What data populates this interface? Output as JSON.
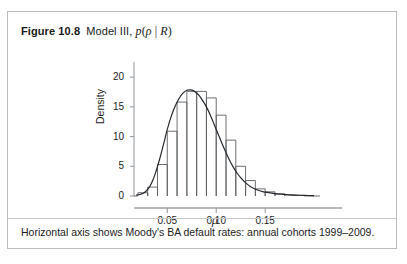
{
  "figure": {
    "number_label": "Figure 10.8",
    "title_text": "Model III, p(ρ | R)",
    "title_parts": {
      "prefix": "Model III,",
      "func": "p",
      "open": "(",
      "arg": "ρ",
      "bar": "|",
      "cond": "R",
      "close": ")"
    },
    "caption": "Horizontal axis shows Moody's BA default rates: annual cohorts 1999–2009.",
    "border_color": "#b9bdc0",
    "background": "#ffffff"
  },
  "chart_data": {
    "type": "bar",
    "xlabel": "ρ",
    "ylabel": "Density",
    "xlim": [
      0.016,
      0.206
    ],
    "ylim": [
      0,
      21.2
    ],
    "xticks": [
      0.05,
      0.1,
      0.15
    ],
    "xtick_labels": [
      "0.05",
      "0.10",
      "0.15"
    ],
    "yticks": [
      0,
      5,
      10,
      15,
      20
    ],
    "ytick_labels": [
      "0",
      "5",
      "10",
      "15",
      "20"
    ],
    "grid": false,
    "legend": null,
    "bin_width": 0.01,
    "bin_edges": [
      0.02,
      0.03,
      0.04,
      0.05,
      0.06,
      0.07,
      0.08,
      0.09,
      0.1,
      0.11,
      0.12,
      0.13,
      0.14,
      0.15,
      0.16,
      0.17,
      0.18,
      0.19
    ],
    "values": [
      0.55,
      1.5,
      5.3,
      10.9,
      15.8,
      17.6,
      17.6,
      16.5,
      13.6,
      9.4,
      5.0,
      2.6,
      1.2,
      0.7,
      0.35,
      0.2,
      0.1
    ],
    "series": [
      {
        "name": "histogram",
        "type": "bar",
        "values": [
          0.55,
          1.5,
          5.3,
          10.9,
          15.8,
          17.6,
          17.6,
          16.5,
          13.6,
          9.4,
          5.0,
          2.6,
          1.2,
          0.7,
          0.35,
          0.2,
          0.1
        ]
      },
      {
        "name": "density-curve",
        "type": "line",
        "x": [
          0.018,
          0.022,
          0.026,
          0.03,
          0.034,
          0.038,
          0.042,
          0.046,
          0.05,
          0.054,
          0.058,
          0.062,
          0.066,
          0.07,
          0.074,
          0.078,
          0.082,
          0.086,
          0.09,
          0.094,
          0.098,
          0.102,
          0.106,
          0.11,
          0.114,
          0.118,
          0.122,
          0.126,
          0.13,
          0.134,
          0.138,
          0.142,
          0.146,
          0.15,
          0.158,
          0.166,
          0.174,
          0.182,
          0.19,
          0.2
        ],
        "y": [
          0.15,
          0.25,
          0.5,
          1.1,
          2.2,
          3.9,
          6.1,
          8.6,
          11.2,
          13.4,
          15.1,
          16.4,
          17.3,
          17.8,
          17.85,
          17.6,
          17.0,
          16.1,
          15.0,
          13.6,
          12.0,
          10.4,
          8.8,
          7.3,
          5.9,
          4.7,
          3.7,
          2.9,
          2.2,
          1.7,
          1.3,
          1.0,
          0.8,
          0.65,
          0.45,
          0.3,
          0.2,
          0.14,
          0.1,
          0.07
        ]
      }
    ],
    "colors": {
      "bar_stroke": "#5b5f63",
      "bar_fill": "none",
      "curve": "#26292c",
      "axis": "#9ba0a4",
      "tick": "#9ba0a4",
      "text": "#1c1c1c"
    }
  }
}
